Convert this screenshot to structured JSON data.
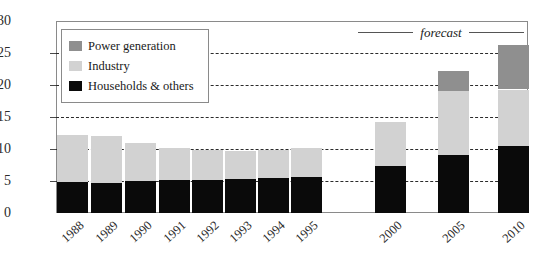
{
  "chart_data": {
    "type": "bar",
    "subtype": "stacked-bar",
    "title": "",
    "xlabel": "",
    "ylabel": "",
    "ylim": [
      0,
      30
    ],
    "ytick_values": [
      0,
      5,
      10,
      15,
      20,
      25,
      30
    ],
    "ytick_labels": [
      "0",
      "5",
      "10",
      "15",
      "20",
      "25",
      "30"
    ],
    "grid": true,
    "grid_style": "dashed horizontal",
    "legend_position": "top-left inside plot",
    "categories": [
      "1988",
      "1989",
      "1990",
      "1991",
      "1992",
      "1993",
      "1994",
      "1995",
      "2000",
      "2005",
      "2010"
    ],
    "series": [
      {
        "name": "Households & others",
        "color": "#0a0a0a",
        "values": [
          4.8,
          4.7,
          5.0,
          5.2,
          5.2,
          5.3,
          5.5,
          5.7,
          7.3,
          9.0,
          10.5
        ]
      },
      {
        "name": "Industry",
        "color": "#d2d2d2",
        "values": [
          7.4,
          7.4,
          6.0,
          4.9,
          4.6,
          4.4,
          4.4,
          4.5,
          6.9,
          10.0,
          8.8
        ]
      },
      {
        "name": "Power generation",
        "color": "#8f8f8f",
        "values": [
          0,
          0,
          0,
          0,
          0,
          0,
          0,
          0,
          0,
          3.2,
          6.9
        ]
      }
    ],
    "totals": [
      12.2,
      12.1,
      11.0,
      10.1,
      9.8,
      9.7,
      9.9,
      10.2,
      14.2,
      22.2,
      26.2
    ],
    "annotations": [
      {
        "text": "forecast",
        "style": "italic",
        "position": "top-right",
        "rules": "horizontal lines both sides"
      }
    ]
  },
  "legend": {
    "items": [
      {
        "label": "Power generation",
        "color": "#8f8f8f"
      },
      {
        "label": "Industry",
        "color": "#d2d2d2"
      },
      {
        "label": "Households & others",
        "color": "#0a0a0a"
      }
    ]
  },
  "annotation": {
    "forecast_label": "forecast"
  }
}
